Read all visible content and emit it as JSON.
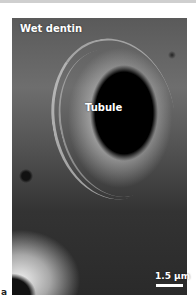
{
  "figure": {
    "panel_letter": "a",
    "labels": {
      "sample": "Wet dentin",
      "feature": "Tubule"
    },
    "scale_bar": {
      "label": "1.5 µm",
      "color": "#ffffff"
    },
    "image_type": "scanning-electron-micrograph"
  }
}
